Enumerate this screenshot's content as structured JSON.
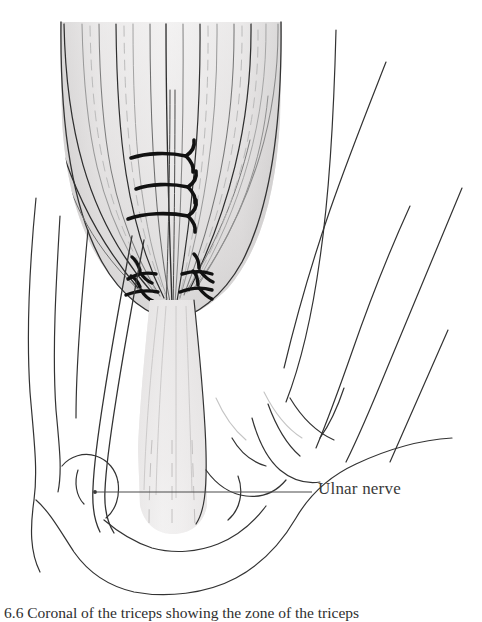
{
  "figure": {
    "domain": "anatomical-illustration",
    "background_color": "#ffffff",
    "ink_color": "#333333",
    "width": 482,
    "height": 618
  },
  "labels": {
    "ulnar_nerve": "Ulnar nerve"
  },
  "caption": {
    "number": "6.6",
    "text": "6.6  Coronal  of the triceps showing the zone of the triceps"
  },
  "annotations": {
    "leader_line": {
      "x_start": 95,
      "x_end": 312,
      "y": 492,
      "color": "#4a4a4a"
    }
  },
  "palette": {
    "muscle_light": "#eceaea",
    "muscle_mid": "#d8d6d6",
    "muscle_dark": "#b4b2b2",
    "tendon": "#ececec",
    "outline": "#333333",
    "fiber_dark": "#2f2f2f",
    "fiber_light": "#8c8c8c",
    "suture": "#111111",
    "label_text": "#3a3a3a"
  },
  "structures": [
    {
      "name": "triceps-muscle-belly",
      "description": "V-shaped shaded muscle belly with converging fibers"
    },
    {
      "name": "triceps-tendon",
      "description": "Central pale tendon descending to olecranon"
    },
    {
      "name": "olecranon",
      "description": "Bony prominence at elbow"
    },
    {
      "name": "ulnar-nerve",
      "description": "Paired-line nerve descending medially behind epicondyle"
    },
    {
      "name": "upper-suture-group",
      "count": 3
    },
    {
      "name": "lower-suture-group",
      "count": 4
    },
    {
      "name": "arm-contours-right",
      "count": 5
    },
    {
      "name": "arm-contours-left",
      "count": 3
    }
  ]
}
